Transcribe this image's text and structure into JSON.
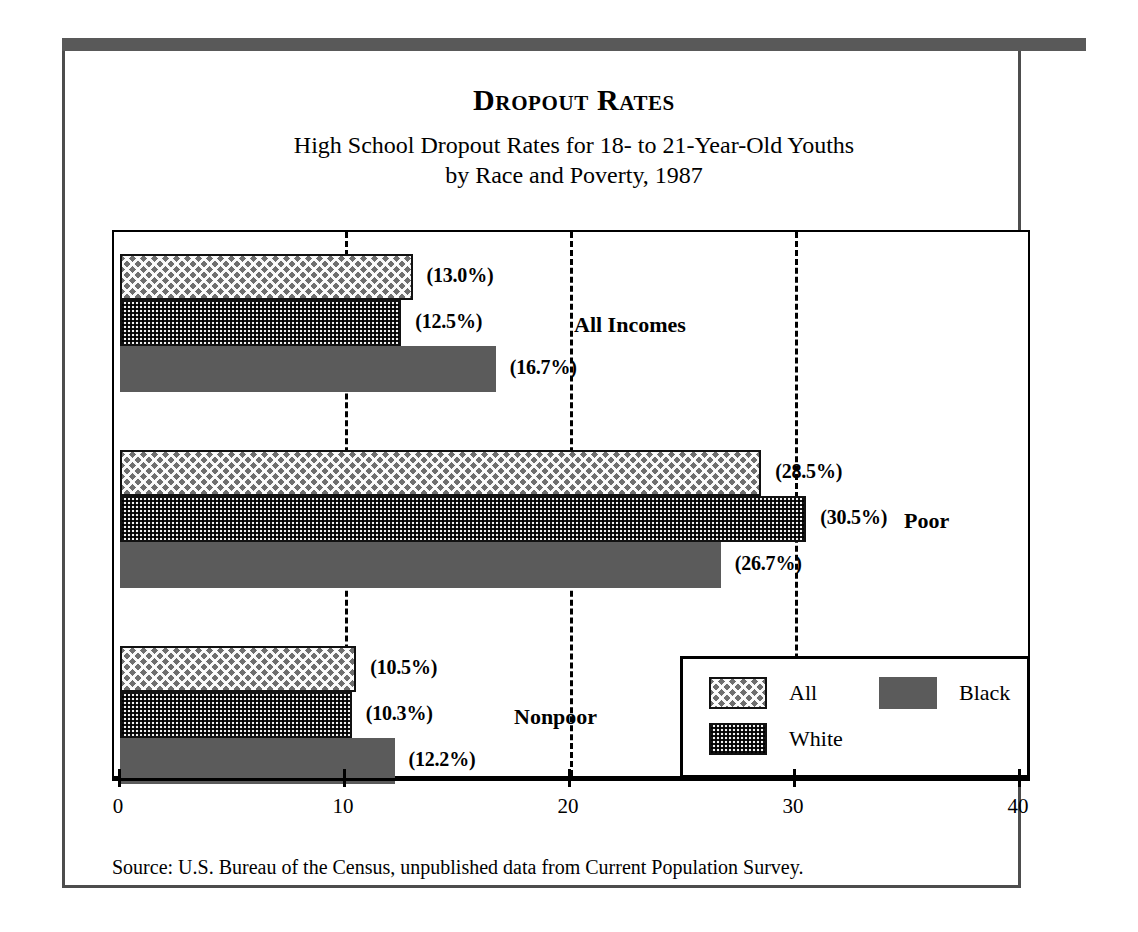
{
  "figure": {
    "title": "Dropout Rates",
    "subtitle_line1": "High School Dropout Rates for 18- to 21-Year-Old Youths",
    "subtitle_line2": "by Race and Poverty, 1987",
    "source": "Source: U.S. Bureau of the Census, unpublished data from Current Population Survey."
  },
  "colors": {
    "rule": "#595959",
    "frame": "#4d4d4d",
    "axis": "#000000",
    "all_fill": "#6e6e6e",
    "white_fill": "#f2f2f2",
    "black_fill": "#5b5b5b"
  },
  "legend": {
    "entries": [
      {
        "label": "All",
        "pattern": "hatch-weave"
      },
      {
        "label": "White",
        "pattern": "dotted"
      },
      {
        "label": "Black",
        "pattern": "solid-gray"
      }
    ]
  },
  "axis": {
    "ticks": [
      "0",
      "10",
      "20",
      "30",
      "40"
    ],
    "tick_values": [
      0,
      10,
      20,
      30,
      40
    ],
    "gridlines_at": [
      10,
      20,
      30
    ]
  },
  "groups": [
    {
      "label": "All Incomes",
      "bars": [
        {
          "series": "All",
          "value": 13.0,
          "label": "(13.0%)"
        },
        {
          "series": "White",
          "value": 12.5,
          "label": "(12.5%)"
        },
        {
          "series": "Black",
          "value": 16.7,
          "label": "(16.7%)"
        }
      ]
    },
    {
      "label": "Poor",
      "bars": [
        {
          "series": "All",
          "value": 28.5,
          "label": "(28.5%)"
        },
        {
          "series": "White",
          "value": 30.5,
          "label": "(30.5%)"
        },
        {
          "series": "Black",
          "value": 26.7,
          "label": "(26.7%)"
        }
      ]
    },
    {
      "label": "Nonpoor",
      "bars": [
        {
          "series": "All",
          "value": 10.5,
          "label": "(10.5%)"
        },
        {
          "series": "White",
          "value": 10.3,
          "label": "(10.3%)"
        },
        {
          "series": "Black",
          "value": 12.2,
          "label": "(12.2%)"
        }
      ]
    }
  ],
  "chart_data": {
    "type": "bar",
    "orientation": "horizontal",
    "title": "Dropout Rates",
    "subtitle": "High School Dropout Rates for 18- to 21-Year-Old Youths by Race and Poverty, 1987",
    "xlabel": "",
    "ylabel": "",
    "xlim": [
      0,
      40
    ],
    "xticks": [
      0,
      10,
      20,
      30,
      40
    ],
    "grid": "vertical-dashed",
    "legend_position": "inside-bottom-right",
    "categories": [
      "All Incomes",
      "Poor",
      "Nonpoor"
    ],
    "series": [
      {
        "name": "All",
        "values": [
          13.0,
          28.5,
          10.5
        ]
      },
      {
        "name": "White",
        "values": [
          12.5,
          30.5,
          10.3
        ]
      },
      {
        "name": "Black",
        "values": [
          16.7,
          26.7,
          12.2
        ]
      }
    ],
    "data_labels": [
      [
        "(13.0%)",
        "(28.5%)",
        "(10.5%)"
      ],
      [
        "(12.5%)",
        "(30.5%)",
        "(10.3%)"
      ],
      [
        "(16.7%)",
        "(26.7%)",
        "(12.2%)"
      ]
    ],
    "source": "Source: U.S. Bureau of the Census, unpublished data from Current Population Survey."
  }
}
